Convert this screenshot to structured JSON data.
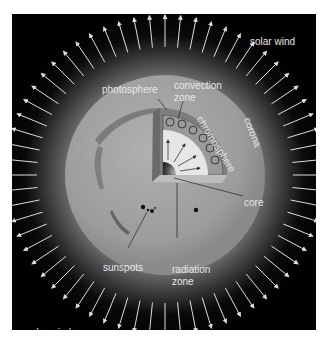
{
  "figure": {
    "colors": {
      "frame": "#ffffff",
      "panel": "#000000",
      "corona_glow": "#8a8a8a",
      "surface": "#9a9a9a",
      "interior": "#d8d8d8",
      "label": "#e8e8e8",
      "arrow": "#dddddd"
    },
    "labels": {
      "solar_wind_top": "solar wind",
      "solar_wind_bottom": "solar wind",
      "photosphere": "photosphere",
      "convection_zone_1": "convection",
      "convection_zone_2": "zone",
      "chromosphere": "chromosphere",
      "corona": "corona",
      "core": "core",
      "sunspots": "sunspots",
      "radiation_zone_1": "radiation",
      "radiation_zone_2": "zone"
    },
    "arrow_count": 64
  }
}
